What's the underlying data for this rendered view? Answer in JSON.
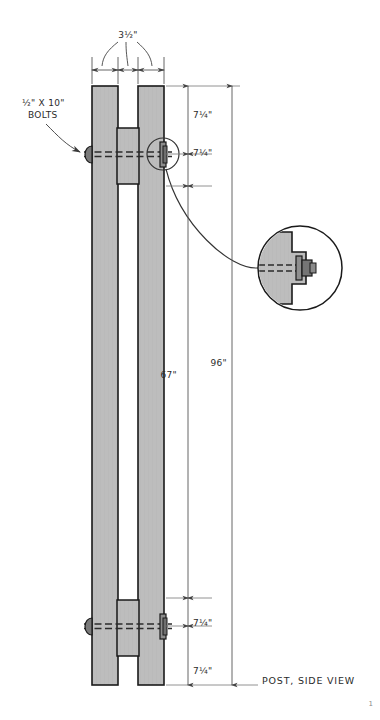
{
  "drawing": {
    "caption": "POST, SIDE VIEW",
    "corner_mark": "1",
    "colors": {
      "background": "#ffffff",
      "wood_fill": "#b9b9b9",
      "wood_fill_light": "#c6c6c6",
      "outline": "#1a1a1a",
      "dimension_line": "#555555",
      "text": "#2b2b2b",
      "hatch": "#9a9a9a"
    },
    "callouts": {
      "bolts_label_line1": "½\" X 10\"",
      "bolts_label_line2": "BOLTS",
      "width_label": "3½\""
    },
    "dimensions": {
      "top_first": "7¼\"",
      "top_second": "7¼\"",
      "middle_inner": "67\"",
      "overall": "96\"",
      "bottom_first": "7¼\"",
      "bottom_second": "7¼\""
    }
  }
}
